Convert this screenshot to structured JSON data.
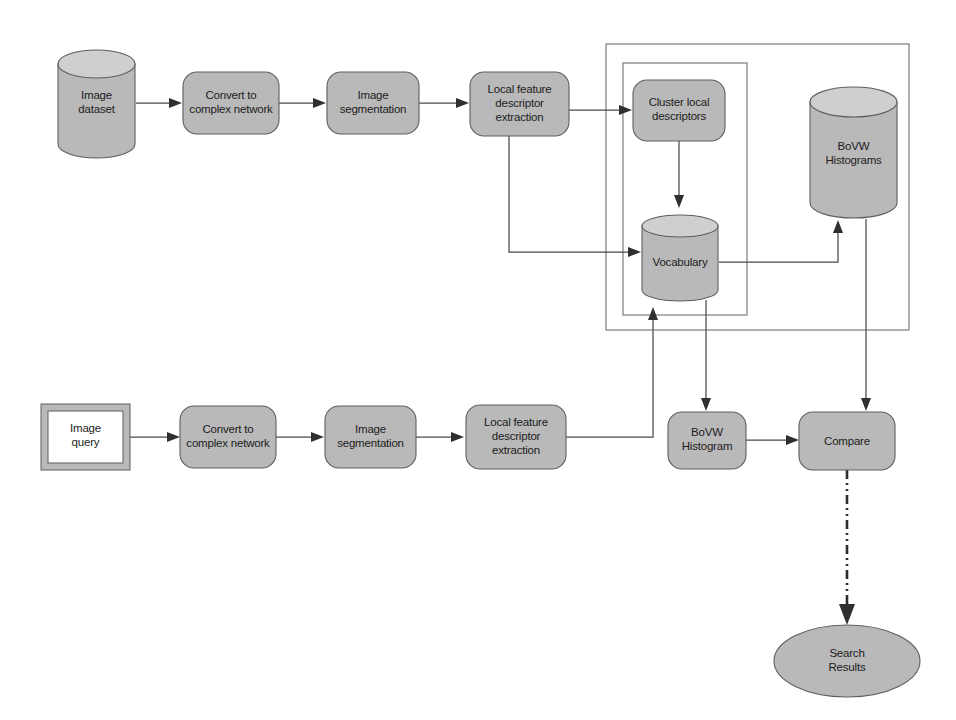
{
  "diagram": {
    "colors": {
      "shape_fill": "#b9b9b9",
      "cylinder_top": "#cfcfcf",
      "shape_stroke": "#5e5e5e",
      "container_stroke": "#6f6f6f",
      "connector": "#4a4a4a",
      "dashdot_connector": "#2c2c2c",
      "query_fill": "#ffffff",
      "background": "#ffffff",
      "text": "#1c1c1c"
    },
    "training_branch": {
      "name": "Training / indexing branch",
      "nodes": {
        "image_dataset": {
          "line1": "Image",
          "line2": "dataset",
          "shape": "cylinder"
        },
        "convert_top": {
          "line1": "Convert to",
          "line2": "complex network",
          "shape": "rounded-rect"
        },
        "segmentation_top": {
          "line1": "Image",
          "line2": "segmentation",
          "shape": "rounded-rect"
        },
        "local_feature_top": {
          "line1": "Local feature",
          "line2": "descriptor",
          "line3": "extraction",
          "shape": "rounded-rect"
        },
        "cluster_local": {
          "line1": "Cluster local",
          "line2": "descriptors",
          "shape": "rounded-rect"
        },
        "vocabulary": {
          "line1": "Vocabulary",
          "shape": "cylinder"
        },
        "bovw_histograms": {
          "line1": "BoVW",
          "line2": "Histograms",
          "shape": "cylinder"
        }
      }
    },
    "query_branch": {
      "name": "Query branch",
      "nodes": {
        "image_query": {
          "line1": "Image",
          "line2": "query",
          "shape": "framed-rect"
        },
        "convert_bottom": {
          "line1": "Convert to",
          "line2": "complex network",
          "shape": "rounded-rect"
        },
        "segmentation_bottom": {
          "line1": "Image",
          "line2": "segmentation",
          "shape": "rounded-rect"
        },
        "local_feature_bottom": {
          "line1": "Local feature",
          "line2": "descriptor",
          "line3": "extraction",
          "shape": "rounded-rect"
        },
        "bovw_histogram": {
          "line1": "BoVW",
          "line2": "Histogram",
          "shape": "rounded-rect"
        },
        "compare": {
          "line1": "Compare",
          "shape": "rounded-rect"
        },
        "search_results": {
          "line1": "Search",
          "line2": "Results",
          "shape": "ellipse"
        }
      }
    },
    "containers": {
      "outer_group": {
        "label": "",
        "name": "vocabulary-and-histograms-group"
      },
      "inner_group": {
        "label": "",
        "name": "vocabulary-build-group"
      }
    },
    "edges": [
      {
        "from": "image_dataset",
        "to": "convert_top",
        "style": "solid-arrow"
      },
      {
        "from": "convert_top",
        "to": "segmentation_top",
        "style": "solid-arrow"
      },
      {
        "from": "segmentation_top",
        "to": "local_feature_top",
        "style": "solid-arrow"
      },
      {
        "from": "local_feature_top",
        "to": "cluster_local",
        "style": "solid-arrow"
      },
      {
        "from": "local_feature_top",
        "to": "vocabulary",
        "style": "solid-arrow-elbow"
      },
      {
        "from": "cluster_local",
        "to": "vocabulary",
        "style": "solid-arrow"
      },
      {
        "from": "vocabulary",
        "to": "bovw_histograms",
        "style": "solid-arrow-elbow"
      },
      {
        "from": "image_query",
        "to": "convert_bottom",
        "style": "solid-arrow"
      },
      {
        "from": "convert_bottom",
        "to": "segmentation_bottom",
        "style": "solid-arrow"
      },
      {
        "from": "segmentation_bottom",
        "to": "local_feature_bottom",
        "style": "solid-arrow"
      },
      {
        "from": "local_feature_bottom",
        "to": "vocabulary",
        "style": "solid-arrow-elbow"
      },
      {
        "from": "vocabulary",
        "to": "bovw_histogram",
        "style": "solid-arrow"
      },
      {
        "from": "bovw_histograms",
        "to": "compare",
        "style": "solid-arrow"
      },
      {
        "from": "bovw_histogram",
        "to": "compare",
        "style": "solid-arrow"
      },
      {
        "from": "compare",
        "to": "search_results",
        "style": "dash-dot-arrow"
      }
    ]
  }
}
